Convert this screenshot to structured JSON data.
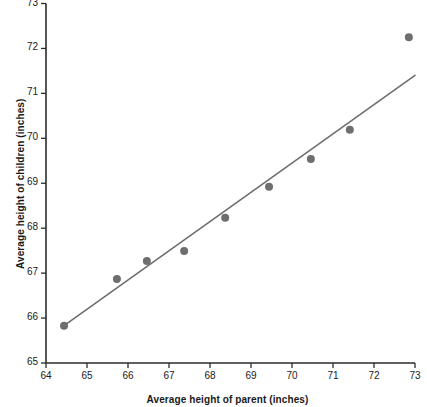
{
  "chart_data": {
    "type": "scatter",
    "title": "",
    "xlabel": "Average height of parent (inches)",
    "ylabel": "Average height of children (inches)",
    "xlim": [
      64,
      73
    ],
    "ylim": [
      65,
      73
    ],
    "xticks": [
      64,
      65,
      66,
      67,
      68,
      69,
      70,
      71,
      72,
      73
    ],
    "xtick_labels": [
      "64",
      "65",
      "66",
      "67",
      "68",
      "69",
      "70",
      "71",
      "72",
      "73"
    ],
    "yticks": [
      65,
      66,
      67,
      68,
      69,
      70,
      71,
      72,
      73
    ],
    "ytick_labels": [
      "65",
      "66",
      "67",
      "68",
      "69",
      "70",
      "71",
      "72",
      "73"
    ],
    "grid": false,
    "legend": null,
    "marker": {
      "shape": "circle",
      "color": "#6e6e6e",
      "size_px": 8
    },
    "points": [
      {
        "x": 64.44,
        "y": 65.83
      },
      {
        "x": 65.73,
        "y": 66.87
      },
      {
        "x": 66.46,
        "y": 67.27
      },
      {
        "x": 67.37,
        "y": 67.49
      },
      {
        "x": 68.37,
        "y": 68.23
      },
      {
        "x": 69.44,
        "y": 68.92
      },
      {
        "x": 70.46,
        "y": 69.54
      },
      {
        "x": 71.41,
        "y": 70.19
      },
      {
        "x": 72.85,
        "y": 72.25
      }
    ],
    "series": [
      {
        "name": "Average height of children",
        "type": "scatter",
        "x": [
          64.44,
          65.73,
          66.46,
          67.37,
          68.37,
          69.44,
          70.46,
          71.41,
          72.85
        ],
        "values": [
          65.83,
          66.87,
          67.27,
          67.49,
          68.23,
          68.92,
          69.54,
          70.19,
          72.25
        ]
      },
      {
        "name": "regression line",
        "type": "line",
        "color": "#6e6e6e",
        "x": [
          64.44,
          73.0
        ],
        "values": [
          65.83,
          71.4
        ]
      }
    ],
    "trendline": {
      "x0": 64.44,
      "y0": 65.83,
      "x1": 73.0,
      "y1": 71.4,
      "color": "#6e6e6e",
      "width_px": 1.6
    },
    "axis_color": "#2b2b2b"
  }
}
